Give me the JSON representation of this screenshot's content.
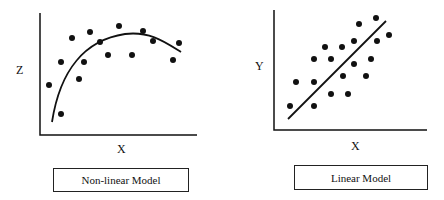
{
  "chart_data": [
    {
      "type": "scatter",
      "title": "Non-linear Model",
      "xlabel": "X",
      "ylabel": "Z",
      "fit": "curve",
      "points_px": [
        [
          49,
          85
        ],
        [
          61,
          114
        ],
        [
          61,
          62
        ],
        [
          72,
          38
        ],
        [
          79,
          79
        ],
        [
          84,
          62
        ],
        [
          90,
          32
        ],
        [
          100,
          42
        ],
        [
          108,
          55
        ],
        [
          119,
          26
        ],
        [
          132,
          55
        ],
        [
          143,
          31
        ],
        [
          153,
          41
        ],
        [
          173,
          60
        ],
        [
          179,
          43
        ]
      ],
      "curve_px": "M52,122 C60,70 85,40 125,34 C150,31 165,42 181,52"
    },
    {
      "type": "scatter",
      "title": "Linear Model",
      "xlabel": "X",
      "ylabel": "Y",
      "fit": "line",
      "points_px": [
        [
          290,
          106
        ],
        [
          296,
          82
        ],
        [
          314,
          59
        ],
        [
          314,
          82
        ],
        [
          314,
          106
        ],
        [
          325,
          47
        ],
        [
          331,
          59
        ],
        [
          331,
          94
        ],
        [
          342,
          47
        ],
        [
          343,
          76
        ],
        [
          348,
          94
        ],
        [
          354,
          41
        ],
        [
          354,
          64
        ],
        [
          359,
          24
        ],
        [
          366,
          76
        ],
        [
          371,
          59
        ],
        [
          376,
          18
        ],
        [
          377,
          41
        ],
        [
          389,
          35
        ]
      ],
      "line_px": [
        [
          288,
          119
        ],
        [
          386,
          21
        ]
      ]
    }
  ],
  "left": {
    "ylabel": "Z",
    "xlabel": "X",
    "caption": "Non-linear Model"
  },
  "right": {
    "ylabel": "Y",
    "xlabel": "X",
    "caption": "Linear Model"
  }
}
